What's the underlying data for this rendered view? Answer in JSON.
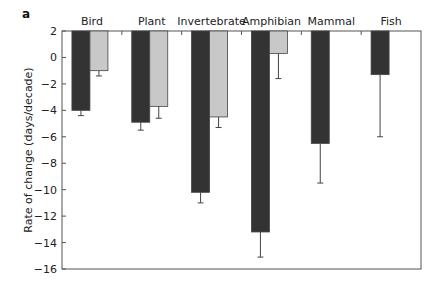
{
  "chart_data": {
    "type": "bar",
    "panel_label": "a",
    "title": "",
    "xlabel": "",
    "ylabel": "Rate of change (days/decade)",
    "ylim": [
      -16,
      2
    ],
    "yticks": [
      2,
      0,
      -2,
      -4,
      -6,
      -8,
      -10,
      -12,
      -14,
      -16
    ],
    "grid": false,
    "legend": null,
    "bar_baseline": 2,
    "categories": [
      "Bird",
      "Plant",
      "Invertebrate",
      "Amphibian",
      "Mammal",
      "Fish"
    ],
    "series": [
      {
        "name": "series-dark",
        "color": "#333333",
        "values": [
          -4.0,
          -4.9,
          -10.2,
          -13.2,
          -6.5,
          -1.3
        ],
        "error_low": [
          -4.4,
          -5.5,
          -11.0,
          -15.1,
          -9.5,
          -6.0
        ]
      },
      {
        "name": "series-light",
        "color": "#c8c8c8",
        "values": [
          -1.0,
          -3.7,
          -4.5,
          0.3,
          null,
          null
        ],
        "error_low": [
          -1.4,
          -4.6,
          -5.3,
          -1.6,
          null,
          null
        ]
      }
    ]
  }
}
